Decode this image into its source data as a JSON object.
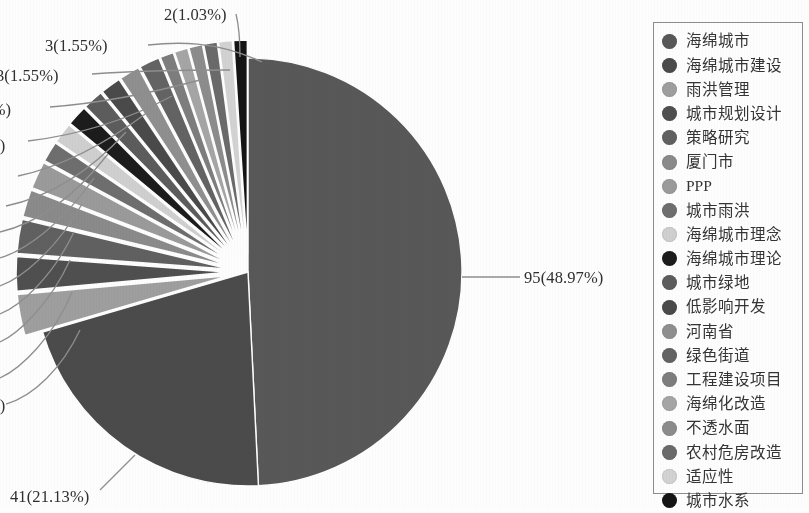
{
  "chart_data": {
    "type": "pie",
    "title": "",
    "total": 194,
    "legend_position": "right",
    "categories": [
      "海绵城市",
      "海绵城市建设",
      "雨洪管理",
      "城市规划设计",
      "策略研究",
      "厦门市",
      "PPP",
      "城市雨洪",
      "海绵城市理念",
      "海绵城市理论",
      "城市绿地",
      "低影响开发",
      "河南省",
      "绿色街道",
      "工程建设项目",
      "海绵化改造",
      "不透水面",
      "农村危房改造",
      "适应性",
      "城市水系"
    ],
    "values": [
      95,
      41,
      6,
      5,
      5,
      4,
      4,
      3,
      3,
      3,
      3,
      3,
      3,
      3,
      2,
      2,
      2,
      2,
      2,
      2
    ],
    "percents": [
      48.97,
      21.13,
      3.09,
      2.58,
      2.58,
      2.06,
      2.06,
      1.55,
      1.55,
      1.55,
      1.55,
      1.55,
      1.55,
      1.55,
      1.03,
      1.03,
      1.03,
      1.03,
      1.03,
      1.03
    ],
    "colors": [
      "#585858",
      "#4b4b4b",
      "#9e9e9e",
      "#4f4f4f",
      "#606060",
      "#8a8a8a",
      "#9a9a9a",
      "#6e6e6e",
      "#cfcfcf",
      "#1c1c1c",
      "#5c5c5c",
      "#4a4a4a",
      "#8f8f8f",
      "#636363",
      "#7d7d7d",
      "#a5a5a5",
      "#8c8c8c",
      "#6a6a6a",
      "#d2d2d2",
      "#141414"
    ],
    "data_labels": [
      {
        "text": "95(48.97%)",
        "value": 95,
        "percent": 48.97
      },
      {
        "text": "41(21.13%)",
        "value": 41,
        "percent": 21.13
      },
      {
        "text": "2(1.03%)",
        "value": 2,
        "percent": 1.03
      },
      {
        "text": "3(1.55%)",
        "value": 3,
        "percent": 1.55
      },
      {
        "text": "3(1.55%)",
        "value": 3,
        "percent": 1.55
      },
      {
        "text": "55%)",
        "value": 3,
        "percent": 1.55
      },
      {
        "text": "%)",
        "value": 3,
        "percent": 1.55
      },
      {
        "text": "%)",
        "value": 2,
        "percent": 1.03
      }
    ]
  },
  "callouts": [
    {
      "id": "c_2_103",
      "text": "2(1.03%)",
      "x": 164,
      "y": 5,
      "align": "left"
    },
    {
      "id": "c_3_155_a",
      "text": "3(1.55%)",
      "x": 45,
      "y": 36,
      "align": "left"
    },
    {
      "id": "c_3_155_b",
      "text": "3(1.55%)",
      "x": -4,
      "y": 66,
      "align": "left"
    },
    {
      "id": "c_cut_55",
      "text": "55%)",
      "x": -25,
      "y": 100,
      "align": "left"
    },
    {
      "id": "c_cut_p1",
      "text": "%)",
      "x": -14,
      "y": 136,
      "align": "left"
    },
    {
      "id": "c_cut_p2",
      "text": "%)",
      "x": -14,
      "y": 396,
      "align": "left"
    },
    {
      "id": "c_41_2113",
      "text": "41(21.13%)",
      "x": 10,
      "y": 487,
      "align": "left"
    },
    {
      "id": "c_95_4897",
      "text": "95(48.97%)",
      "x": 524,
      "y": 268,
      "align": "left"
    }
  ],
  "legend": {
    "items": [
      {
        "label": "海绵城市",
        "color": "#585858"
      },
      {
        "label": "海绵城市建设",
        "color": "#4b4b4b"
      },
      {
        "label": "雨洪管理",
        "color": "#9e9e9e"
      },
      {
        "label": "城市规划设计",
        "color": "#4f4f4f"
      },
      {
        "label": "策略研究",
        "color": "#606060"
      },
      {
        "label": "厦门市",
        "color": "#8a8a8a"
      },
      {
        "label": "PPP",
        "color": "#9a9a9a"
      },
      {
        "label": "城市雨洪",
        "color": "#6e6e6e"
      },
      {
        "label": "海绵城市理念",
        "color": "#cfcfcf"
      },
      {
        "label": "海绵城市理论",
        "color": "#1c1c1c"
      },
      {
        "label": "城市绿地",
        "color": "#5c5c5c"
      },
      {
        "label": "低影响开发",
        "color": "#4a4a4a"
      },
      {
        "label": "河南省",
        "color": "#8f8f8f"
      },
      {
        "label": "绿色街道",
        "color": "#636363"
      },
      {
        "label": "工程建设项目",
        "color": "#7d7d7d"
      },
      {
        "label": "海绵化改造",
        "color": "#a5a5a5"
      },
      {
        "label": "不透水面",
        "color": "#8c8c8c"
      },
      {
        "label": "农村危房改造",
        "color": "#6a6a6a"
      },
      {
        "label": "适应性",
        "color": "#d2d2d2"
      },
      {
        "label": "城市水系",
        "color": "#141414"
      }
    ]
  },
  "geometry": {
    "center_x": 248,
    "center_y": 272,
    "radius": 214,
    "explode_radius": 18,
    "start_angle_deg": -90
  }
}
